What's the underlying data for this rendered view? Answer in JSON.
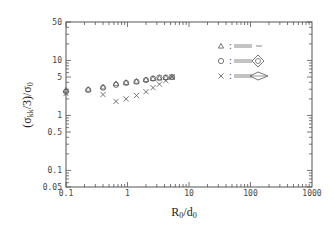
{
  "chart_data": {
    "type": "scatter",
    "title": "",
    "xlabel": "R0/d0",
    "ylabel": "(σkk/3)/σ0",
    "xscale": "log",
    "yscale": "log",
    "xlim": [
      0.1,
      1000
    ],
    "ylim": [
      0.05,
      50
    ],
    "grid": false,
    "legend_position": "upper-right",
    "x_ticks": [
      "0.1",
      "1",
      "10",
      "100",
      "1000"
    ],
    "y_ticks": [
      "0.05",
      "0.1",
      "0.5",
      "1",
      "5",
      "10",
      "50"
    ],
    "series": [
      {
        "name": "triangle",
        "marker": "triangle",
        "legend_glyph": "elongated tip notch shape 1",
        "x": [
          0.1,
          0.23,
          0.4,
          0.65,
          0.95,
          1.4,
          2.0,
          2.6,
          3.3,
          4.2,
          5.3
        ],
        "y": [
          2.9,
          3.0,
          3.3,
          3.8,
          4.0,
          4.2,
          4.5,
          4.7,
          4.8,
          4.9,
          5.0
        ]
      },
      {
        "name": "circle",
        "marker": "circle",
        "legend_glyph": "elongated tip notch shape 2",
        "x": [
          0.1,
          0.23,
          0.4,
          0.65,
          0.95,
          1.4,
          2.0,
          2.6,
          3.3,
          4.2,
          5.3
        ],
        "y": [
          2.7,
          2.9,
          3.2,
          3.6,
          3.9,
          4.1,
          4.4,
          4.7,
          4.9,
          4.9,
          5.0
        ]
      },
      {
        "name": "cross",
        "marker": "x",
        "legend_glyph": "elongated tip notch shape 3",
        "x": [
          0.1,
          0.4,
          0.65,
          0.95,
          1.4,
          2.0,
          2.6,
          3.3,
          4.2,
          5.3
        ],
        "y": [
          2.5,
          2.4,
          1.8,
          2.0,
          2.3,
          2.7,
          3.2,
          3.7,
          4.3,
          5.0
        ]
      }
    ]
  },
  "labels": {
    "x_axis_title_main": "R",
    "x_axis_title_sub1": "0",
    "x_axis_title_mid": "/d",
    "x_axis_title_sub2": "0",
    "y_axis_title": "(σkk/3)/σ0",
    "legend_separator": ":"
  }
}
